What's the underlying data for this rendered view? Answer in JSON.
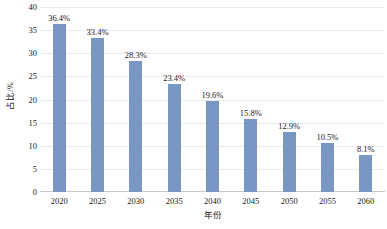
{
  "chart_data": {
    "type": "bar",
    "title": "",
    "subtitle": "",
    "xlabel": "年份",
    "ylabel": "占比/%",
    "categories": [
      "2020",
      "2025",
      "2030",
      "2035",
      "2040",
      "2045",
      "2050",
      "2055",
      "2060"
    ],
    "values": [
      36.4,
      33.4,
      28.3,
      23.4,
      19.6,
      15.8,
      12.9,
      10.5,
      8.1
    ],
    "data_labels": [
      "36.4%",
      "33.4%",
      "28.3%",
      "23.4%",
      "19.6%",
      "15.8%",
      "12.9%",
      "10.5%",
      "8.1%"
    ],
    "ylim": [
      0,
      40
    ],
    "ytick_values": [
      0,
      5,
      10,
      15,
      20,
      25,
      30,
      35,
      40
    ],
    "ytick_labels": [
      "0",
      "5",
      "10",
      "15",
      "20",
      "25",
      "30",
      "35",
      "40"
    ],
    "grid": true,
    "grid_axis": "y",
    "legend": false,
    "legend_position": "none",
    "bar_color": "#7a96c2",
    "gridline_color": "#e9ecef",
    "background_color": "#ffffff"
  }
}
